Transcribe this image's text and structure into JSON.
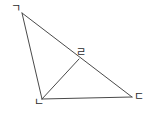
{
  "figure": {
    "background_color": "#ffffff",
    "stroke_color": "#4a4a4a",
    "stroke_width": 1,
    "width": 152,
    "height": 113,
    "points": {
      "ga": {
        "label": "ㄱ",
        "x": 22,
        "y": 13
      },
      "na": {
        "label": "ㄴ",
        "x": 42,
        "y": 99
      },
      "da": {
        "label": "ㄷ",
        "x": 132,
        "y": 97
      },
      "ra": {
        "label": "ㄹ",
        "x": 79,
        "y": 59
      }
    },
    "segments": [
      {
        "name": "segment-ga-na",
        "from": "ga",
        "to": "na"
      },
      {
        "name": "segment-ga-da",
        "from": "ga",
        "to": "da"
      },
      {
        "name": "segment-na-da",
        "from": "na",
        "to": "da"
      },
      {
        "name": "segment-na-ra",
        "from": "na",
        "to": "ra"
      }
    ]
  }
}
